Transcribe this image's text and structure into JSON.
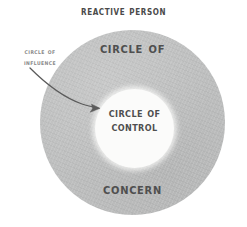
{
  "diagram": {
    "title": "Reactive Person",
    "background_color": "#ffffff",
    "ring": {
      "name": "circle-of-concern",
      "color": "#bfc0c0",
      "label_top": "Circle of",
      "label_bottom": "Concern"
    },
    "inner": {
      "name": "circle-of-control",
      "color": "#fbfbfa",
      "label_line1": "Circle of",
      "label_line2": "Control"
    },
    "callout": {
      "name": "circle-of-influence",
      "line1": "Circle of",
      "line2": "Influence",
      "color": "#8a8a8a",
      "arrow_color": "#5b5b5b"
    }
  }
}
